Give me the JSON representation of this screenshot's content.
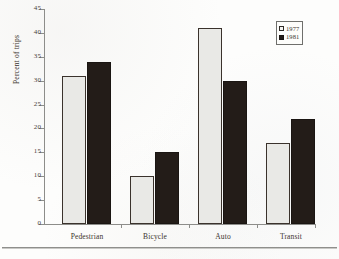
{
  "chart_data": {
    "type": "bar",
    "title": "",
    "subtitle": "",
    "xlabel": "",
    "ylabel": "Percent of trips",
    "categories": [
      "Pedestrian",
      "Bicycle",
      "Auto",
      "Transit"
    ],
    "series": [
      {
        "name": "1977",
        "values": [
          31,
          10,
          41,
          17
        ],
        "color": "#e9e9e6"
      },
      {
        "name": "1981",
        "values": [
          34,
          15,
          30,
          22
        ],
        "color": "#231c18"
      }
    ],
    "ylim": [
      0,
      45
    ],
    "ytick_labels": [
      "0",
      "5",
      "10",
      "15",
      "20",
      "25",
      "30",
      "35",
      "40",
      "45"
    ],
    "ytick_values": [
      0,
      5,
      10,
      15,
      20,
      25,
      30,
      35,
      40,
      45
    ],
    "grid": false,
    "legend_position": "top-right",
    "legend_entries": [
      {
        "label": "1977",
        "marker": "open-square"
      },
      {
        "label": "1981",
        "marker": "filled-square"
      }
    ]
  },
  "figure": {
    "background_color": "#fdfdfc",
    "axis_color": "#8d8d8a",
    "text_color": "#3a332c"
  }
}
